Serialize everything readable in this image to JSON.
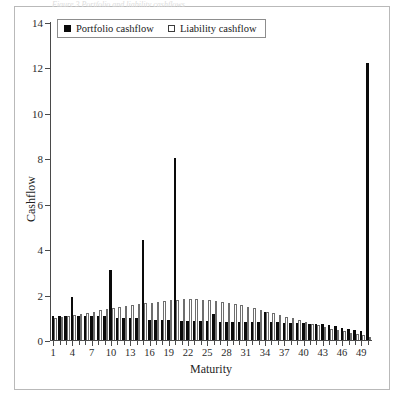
{
  "figure": {
    "caption_sliver": "Figure 3   Portfolio and liability cashflows"
  },
  "legend": {
    "position": "top-left-inside",
    "entries": [
      {
        "label": "Portfolio cashflow",
        "marker": "filled-square",
        "color": "#0a0a0a"
      },
      {
        "label": "Liability cashflow",
        "marker": "open-square",
        "color": "#ffffff"
      }
    ]
  },
  "axes": {
    "x_title": "Maturity",
    "y_title": "Cashflow",
    "y_ticks": [
      0,
      2,
      4,
      6,
      8,
      10,
      12,
      14
    ],
    "y_tick_labels": [
      "0",
      "2",
      "4",
      "6",
      "8",
      "10",
      "12",
      "14"
    ],
    "x_tick_labels": [
      "1",
      "4",
      "7",
      "10",
      "13",
      "16",
      "19",
      "22",
      "25",
      "28",
      "31",
      "34",
      "37",
      "40",
      "43",
      "46",
      "49"
    ]
  },
  "chart_data": {
    "type": "bar",
    "title": "",
    "subtitle": "",
    "xlabel": "Maturity",
    "ylabel": "Cashflow",
    "xlim": [
      0.5,
      50.5
    ],
    "ylim": [
      0,
      14
    ],
    "grid": false,
    "legend_position": "upper left",
    "categories": [
      1,
      2,
      3,
      4,
      5,
      6,
      7,
      8,
      9,
      10,
      11,
      12,
      13,
      14,
      15,
      16,
      17,
      18,
      19,
      20,
      21,
      22,
      23,
      24,
      25,
      26,
      27,
      28,
      29,
      30,
      31,
      32,
      33,
      34,
      35,
      36,
      37,
      38,
      39,
      40,
      41,
      42,
      43,
      44,
      45,
      46,
      47,
      48,
      49,
      50
    ],
    "series": [
      {
        "name": "Portfolio cashflow",
        "color": "#0a0a0a",
        "values": [
          1.05,
          1.05,
          1.05,
          1.9,
          1.05,
          1.05,
          1.05,
          1.05,
          1.05,
          3.1,
          0.95,
          0.95,
          0.95,
          0.95,
          4.4,
          0.9,
          0.9,
          0.9,
          0.9,
          8.0,
          0.85,
          0.85,
          0.85,
          0.85,
          0.85,
          1.15,
          0.8,
          0.8,
          0.8,
          0.8,
          0.8,
          0.8,
          0.8,
          1.25,
          0.8,
          0.8,
          0.75,
          0.75,
          0.75,
          0.75,
          0.7,
          0.7,
          0.7,
          0.65,
          0.6,
          0.55,
          0.5,
          0.45,
          0.4,
          12.2
        ]
      },
      {
        "name": "Liability cashflow",
        "color": "#ffffff",
        "values": [
          0.95,
          1.0,
          1.05,
          1.1,
          1.15,
          1.2,
          1.25,
          1.3,
          1.35,
          1.4,
          1.45,
          1.5,
          1.55,
          1.6,
          1.62,
          1.65,
          1.68,
          1.72,
          1.75,
          1.78,
          1.8,
          1.8,
          1.8,
          1.78,
          1.75,
          1.72,
          1.68,
          1.62,
          1.58,
          1.52,
          1.45,
          1.4,
          1.32,
          1.25,
          1.18,
          1.1,
          1.02,
          0.95,
          0.88,
          0.8,
          0.72,
          0.65,
          0.58,
          0.5,
          0.45,
          0.38,
          0.32,
          0.26,
          0.2,
          0.15
        ]
      }
    ]
  }
}
